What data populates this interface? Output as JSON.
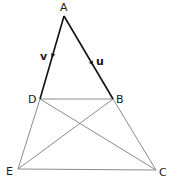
{
  "diagram": {
    "points": {
      "A": {
        "label": "A",
        "x": 64,
        "y": 16
      },
      "B": {
        "label": "B",
        "x": 113,
        "y": 99
      },
      "C": {
        "label": "C",
        "x": 156,
        "y": 170
      },
      "D": {
        "label": "D",
        "x": 40,
        "y": 99
      },
      "E": {
        "label": "E",
        "x": 18,
        "y": 169
      }
    },
    "vectors": {
      "v": {
        "label": "v",
        "from": "A",
        "to": "D"
      },
      "u": {
        "label": "u",
        "from": "A",
        "to": "B"
      }
    },
    "segments": [
      "DB",
      "EC",
      "DE",
      "BC",
      "DC",
      "BE"
    ],
    "colors": {
      "vector_stroke": "#111111",
      "segment_stroke": "#8c8c8c",
      "text": "#1a1a1a"
    }
  }
}
